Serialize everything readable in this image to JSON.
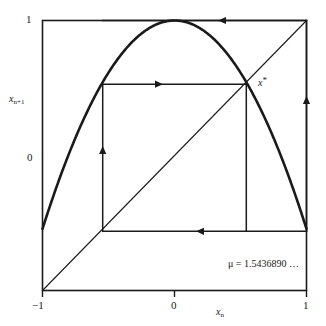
{
  "chart_data": {
    "type": "line",
    "title": "",
    "subtitle": "",
    "xlabel": "x_n",
    "ylabel": "x_{n+1}",
    "xlim": [
      -1,
      1
    ],
    "ylim": [
      -1,
      1
    ],
    "grid": false,
    "legend": null,
    "map_equation": "x_{n+1} = 1 - mu * x_n^2",
    "parameter_name": "mu",
    "parameter_value": 1.543689,
    "series": [
      {
        "name": "map curve f(x) = 1 - mu x^2",
        "type": "curve",
        "x": [
          -1.0,
          -0.9,
          -0.8,
          -0.7,
          -0.6,
          -0.5,
          -0.4,
          -0.3,
          -0.2,
          -0.1,
          0.0,
          0.1,
          0.2,
          0.3,
          0.4,
          0.5,
          0.6,
          0.7,
          0.8,
          0.9,
          1.0
        ],
        "y": [
          -0.5437,
          -0.2504,
          0.012,
          0.2436,
          0.4443,
          0.6141,
          0.753,
          0.8611,
          0.9383,
          0.9846,
          1.0,
          0.9846,
          0.9383,
          0.8611,
          0.753,
          0.6141,
          0.4443,
          0.2436,
          0.012,
          -0.2504,
          -0.5437
        ]
      },
      {
        "name": "identity line y = x",
        "type": "line",
        "x": [
          -1.0,
          1.0
        ],
        "y": [
          -1.0,
          1.0
        ]
      },
      {
        "name": "cobweb orbit (period-4 cycle)",
        "type": "cobweb",
        "points": [
          [
            -0.5437,
            -0.5437
          ],
          [
            -0.5437,
            0.5437
          ],
          [
            0.5437,
            0.5437
          ],
          [
            0.5437,
            -0.5437
          ],
          [
            1.0,
            -0.5437
          ],
          [
            1.0,
            1.0
          ],
          [
            -0.5437,
            1.0
          ],
          [
            -0.5437,
            -0.5437
          ]
        ]
      }
    ],
    "annotations": [
      {
        "name": "fixed-point-label",
        "text": "x*",
        "x": 0.545,
        "y": 0.545
      },
      {
        "name": "parameter-annotation",
        "text": "μ = 1.5436890 …",
        "x": 0.45,
        "y": -0.75
      }
    ],
    "xticks": [
      {
        "value": -1,
        "label": "−1"
      },
      {
        "value": 0,
        "label": "0"
      },
      {
        "value": 1,
        "label": "1"
      }
    ],
    "yticks": [
      {
        "value": 0,
        "label": "0"
      },
      {
        "value": 1,
        "label": "1"
      }
    ]
  },
  "labels": {
    "y_axis_base": "x",
    "y_axis_sub": "n+1",
    "x_axis_base": "x",
    "x_axis_sub": "n",
    "fixed_point_base": "x",
    "fixed_point_star": "*",
    "y_tick_1": "1",
    "y_tick_0": "0",
    "x_tick_minus1": "−1",
    "x_tick_0": "0",
    "x_tick_1": "1",
    "parameter_text": "μ = 1.5436890 …"
  },
  "colors": {
    "ink": "#1a1a1a",
    "background": "#ffffff",
    "curve": "#1a1a1a",
    "diagonal": "#1a1a1a",
    "cobweb": "#1a1a1a",
    "frame": "#1a1a1a"
  }
}
